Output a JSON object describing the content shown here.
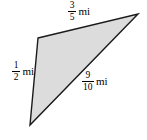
{
  "figure": {
    "name": "shaded-triangle-with-side-lengths",
    "background_color": "#ffffff",
    "fill_color": "#dcdcdc",
    "stroke_color": "#000000",
    "unit": "mi",
    "vertices": {
      "top_left": [
        38,
        38
      ],
      "right": [
        138,
        14
      ],
      "bottom": [
        30,
        125
      ]
    }
  },
  "labels": {
    "top": {
      "numerator": "3",
      "denominator": "5",
      "unit": "mi",
      "side": "top-left-to-right"
    },
    "left": {
      "numerator": "1",
      "denominator": "2",
      "unit": "mi",
      "side": "top-left-to-bottom"
    },
    "diagonal": {
      "numerator": "9",
      "denominator": "10",
      "unit": "mi",
      "side": "bottom-to-right"
    }
  }
}
